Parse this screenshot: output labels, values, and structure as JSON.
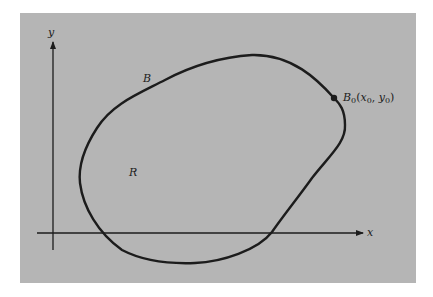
{
  "figure": {
    "background_color": "#b5b5b5",
    "stroke_color": "#1c1c1c",
    "axes": {
      "x_label": "x",
      "y_label": "y"
    },
    "curve": {
      "label": "B",
      "region_label": "R"
    },
    "point": {
      "name": "B",
      "subscript": "0",
      "open_paren": "(",
      "x_var": "x",
      "x_sub": "0",
      "comma": ", ",
      "y_var": "y",
      "y_sub": "0",
      "close_paren": ")"
    }
  }
}
